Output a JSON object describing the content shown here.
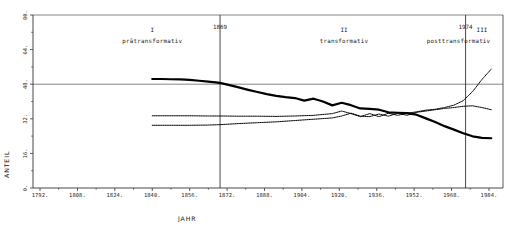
{
  "chart_data": {
    "type": "line",
    "title": "",
    "xlabel": "JAHR",
    "ylabel": "ANTEIL",
    "xlim": [
      1789,
      1990
    ],
    "ylim": [
      0,
      80
    ],
    "grid": false,
    "gridlines_y": [
      48,
      80
    ],
    "xticks": [
      1792,
      1808,
      1824,
      1840,
      1856,
      1872,
      1888,
      1904,
      1920,
      1936,
      1952,
      1968,
      1984
    ],
    "xtick_labels": [
      "1792.",
      "1808.",
      "1824.",
      "1840.",
      "1856.",
      "1872.",
      "1888.",
      "1904.",
      "1920.",
      "1936.",
      "1952.",
      "1968.",
      "1984."
    ],
    "yticks": [
      0,
      16,
      32,
      48,
      64,
      80
    ],
    "ytick_labels": [
      "0.",
      "16.",
      "32.",
      "48.",
      "64.",
      "80."
    ],
    "legend_position": "none",
    "annotations": [
      {
        "name": "phase-1-roman",
        "text": "I",
        "x": 1840,
        "y": 72
      },
      {
        "name": "phase-1-name",
        "text": "prätransformativ",
        "x": 1840,
        "y": 67
      },
      {
        "name": "phase-2-roman",
        "text": "II",
        "x": 1922,
        "y": 72
      },
      {
        "name": "phase-2-name",
        "text": "transformativ",
        "x": 1922,
        "y": 67
      },
      {
        "name": "phase-3-roman",
        "text": "III",
        "x": 1981,
        "y": 72
      },
      {
        "name": "phase-3-name",
        "text": "posttransformativ",
        "x": 1971,
        "y": 67
      }
    ],
    "vlines": [
      {
        "name": "divider-1869",
        "label": "1869",
        "x": 1869
      },
      {
        "name": "divider-1974",
        "label": "1974",
        "x": 1974
      }
    ],
    "series": [
      {
        "name": "series-a",
        "style": "thick-solid",
        "x": [
          1840,
          1844,
          1848,
          1852,
          1856,
          1860,
          1864,
          1869,
          1873,
          1877,
          1881,
          1885,
          1889,
          1893,
          1897,
          1901,
          1905,
          1909,
          1913,
          1917,
          1921,
          1925,
          1929,
          1933,
          1937,
          1941,
          1945,
          1949,
          1953,
          1957,
          1961,
          1965,
          1969,
          1973,
          1977,
          1981,
          1985
        ],
        "values": [
          50.4,
          50.4,
          50.3,
          50.2,
          50.0,
          49.6,
          49.2,
          48.6,
          47.6,
          46.5,
          45.4,
          44.4,
          43.4,
          42.6,
          42.0,
          41.6,
          40.4,
          41.3,
          40.0,
          38.2,
          39.4,
          38.3,
          36.8,
          36.6,
          36.2,
          35.0,
          34.8,
          34.6,
          33.9,
          32.2,
          30.5,
          28.6,
          27.0,
          25.3,
          23.9,
          23.2,
          23.0
        ]
      },
      {
        "name": "series-b",
        "style": "dotted",
        "x": [
          1840,
          1848,
          1856,
          1864,
          1869,
          1877,
          1885,
          1893,
          1901,
          1909,
          1917,
          1921,
          1925,
          1929,
          1933,
          1937,
          1941,
          1945,
          1949,
          1953,
          1957,
          1961,
          1965,
          1969,
          1973,
          1977,
          1981,
          1985
        ],
        "values": [
          33.4,
          33.4,
          33.4,
          33.3,
          33.3,
          33.2,
          33.2,
          33.1,
          33.3,
          33.6,
          34.4,
          35.6,
          34.4,
          33.0,
          34.4,
          33.0,
          34.6,
          33.6,
          34.6,
          35.2,
          36.0,
          36.4,
          37.2,
          38.3,
          40.4,
          44.6,
          50.2,
          55.0
        ]
      },
      {
        "name": "series-c",
        "style": "dotted",
        "x": [
          1840,
          1848,
          1856,
          1864,
          1869,
          1877,
          1885,
          1893,
          1901,
          1909,
          1917,
          1921,
          1925,
          1929,
          1933,
          1937,
          1941,
          1945,
          1949,
          1953,
          1957,
          1961,
          1965,
          1969,
          1973,
          1977,
          1981,
          1985
        ],
        "values": [
          29.0,
          29.0,
          29.0,
          29.1,
          29.3,
          29.8,
          30.2,
          30.6,
          31.2,
          31.8,
          32.4,
          33.3,
          34.6,
          33.2,
          33.0,
          34.2,
          33.2,
          34.6,
          33.6,
          35.0,
          35.6,
          36.2,
          36.8,
          37.2,
          37.8,
          38.0,
          37.2,
          36.2
        ]
      }
    ]
  },
  "colors": {
    "axis": "#333333",
    "gridline": "#666666",
    "series": "#000000",
    "background": "#ffffff"
  }
}
